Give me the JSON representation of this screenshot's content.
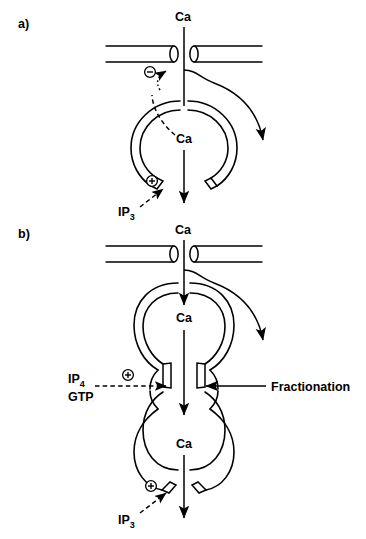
{
  "figure": {
    "background_color": "#ffffff",
    "line_color": "#000000"
  },
  "panels": [
    {
      "id": "a",
      "label": "a)",
      "labels": {
        "ca_top": "Ca",
        "ca_lumen": "Ca",
        "ip3": "IP",
        "ip3_sub": "3"
      },
      "symbols": {
        "minus": "circled-minus",
        "plus": "circled-plus"
      }
    },
    {
      "id": "b",
      "label": "b)",
      "labels": {
        "ca_top": "Ca",
        "ca_lumen_upper": "Ca",
        "ca_lumen_lower": "Ca",
        "ip4": "IP",
        "ip4_sub": "4",
        "gtp": "GTP",
        "ip3": "IP",
        "ip3_sub": "3",
        "fractionation": "Fractionation"
      },
      "symbols": {
        "plus_upper": "circled-plus",
        "plus_lower": "circled-plus"
      }
    }
  ]
}
